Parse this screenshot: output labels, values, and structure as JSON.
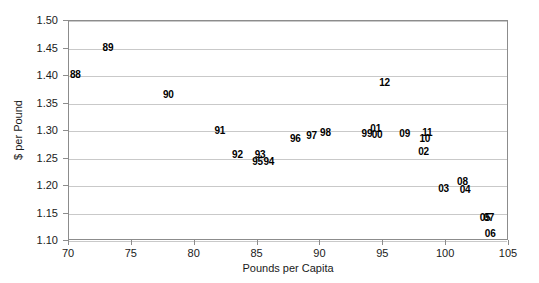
{
  "chart_data": {
    "type": "scatter",
    "title": "",
    "xlabel": "Pounds per Capita",
    "ylabel": "$ per Pound",
    "xlim": [
      70,
      105
    ],
    "ylim": [
      1.1,
      1.5
    ],
    "xticks": [
      "70",
      "75",
      "80",
      "85",
      "90",
      "95",
      "100",
      "105"
    ],
    "xtick_values": [
      70,
      75,
      80,
      85,
      90,
      95,
      100,
      105
    ],
    "yticks": [
      "1.50",
      "1.45",
      "1.40",
      "1.35",
      "1.30",
      "1.25",
      "1.20",
      "1.15",
      "1.10"
    ],
    "ytick_values": [
      1.5,
      1.45,
      1.4,
      1.35,
      1.3,
      1.25,
      1.2,
      1.15,
      1.1
    ],
    "grid": "horizontal",
    "legend": "none",
    "point_style": "text-label-marker",
    "points": [
      {
        "label": "88",
        "x": 70.5,
        "y": 1.404
      },
      {
        "label": "89",
        "x": 73.1,
        "y": 1.452
      },
      {
        "label": "90",
        "x": 77.9,
        "y": 1.368
      },
      {
        "label": "91",
        "x": 82.0,
        "y": 1.301
      },
      {
        "label": "92",
        "x": 83.4,
        "y": 1.258
      },
      {
        "label": "93",
        "x": 85.2,
        "y": 1.258
      },
      {
        "label": "95",
        "x": 85.0,
        "y": 1.245
      },
      {
        "label": "94",
        "x": 85.9,
        "y": 1.245
      },
      {
        "label": "96",
        "x": 88.0,
        "y": 1.287
      },
      {
        "label": "97",
        "x": 89.3,
        "y": 1.293
      },
      {
        "label": "98",
        "x": 90.4,
        "y": 1.299
      },
      {
        "label": "99",
        "x": 93.7,
        "y": 1.297
      },
      {
        "label": "01",
        "x": 94.4,
        "y": 1.305
      },
      {
        "label": "00",
        "x": 94.5,
        "y": 1.294
      },
      {
        "label": "09",
        "x": 96.7,
        "y": 1.297
      },
      {
        "label": "11",
        "x": 98.5,
        "y": 1.298
      },
      {
        "label": "10",
        "x": 98.3,
        "y": 1.288
      },
      {
        "label": "02",
        "x": 98.2,
        "y": 1.263
      },
      {
        "label": "12",
        "x": 95.1,
        "y": 1.39
      },
      {
        "label": "03",
        "x": 99.8,
        "y": 1.196
      },
      {
        "label": "08",
        "x": 101.3,
        "y": 1.209
      },
      {
        "label": "04",
        "x": 101.5,
        "y": 1.195
      },
      {
        "label": "05",
        "x": 103.1,
        "y": 1.143
      },
      {
        "label": "07",
        "x": 103.4,
        "y": 1.143
      },
      {
        "label": "06",
        "x": 103.5,
        "y": 1.115
      }
    ]
  },
  "colors": {
    "background": "#ffffff",
    "frame": "#8c8c8c",
    "gridline": "#c9c9c9",
    "text": "#1a1a1a",
    "marker_text": "#000000"
  }
}
